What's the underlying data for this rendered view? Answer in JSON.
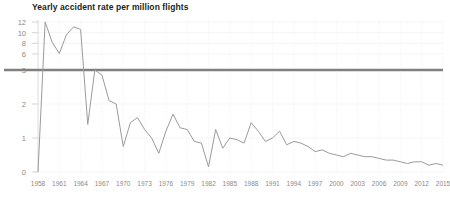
{
  "chart_data": {
    "type": "line",
    "title": "Yearly accident rate per million flights",
    "xlabel": "",
    "ylabel": "",
    "grid": "faint dotted vertical gridlines at every 3rd year",
    "legend": "none",
    "yaxis": {
      "ticks": [
        0,
        1,
        2,
        3,
        6,
        8,
        10,
        12
      ],
      "tick_labels": [
        "0",
        "1",
        "2",
        "3",
        "6",
        "8",
        "10",
        "12"
      ],
      "scale_note": "non-linear: compressed above 3",
      "ylim": [
        0,
        12
      ]
    },
    "xaxis": {
      "tick_labels": [
        "1958",
        "1961",
        "1964",
        "1967",
        "1970",
        "1973",
        "1976",
        "1979",
        "1982",
        "1985",
        "1988",
        "1991",
        "1994",
        "1997",
        "2000",
        "2003",
        "2006",
        "2009",
        "2012",
        "2015"
      ],
      "xlim": [
        1958,
        2015
      ],
      "tick_step": 3
    },
    "reference_line": {
      "value": 3,
      "color": "#808080",
      "label": ""
    },
    "series": [
      {
        "name": "Yearly accident rate per million flights",
        "color": "#9b9b9b",
        "x": [
          1958,
          1959,
          1960,
          1961,
          1962,
          1963,
          1964,
          1965,
          1966,
          1967,
          1968,
          1969,
          1970,
          1971,
          1972,
          1973,
          1974,
          1975,
          1976,
          1977,
          1978,
          1979,
          1980,
          1981,
          1982,
          1983,
          1984,
          1985,
          1986,
          1987,
          1988,
          1989,
          1990,
          1991,
          1992,
          1993,
          1994,
          1995,
          1996,
          1997,
          1998,
          1999,
          2000,
          2001,
          2002,
          2003,
          2004,
          2005,
          2006,
          2007,
          2008,
          2009,
          2010,
          2011,
          2012,
          2013,
          2014,
          2015
        ],
        "values": [
          0,
          12,
          8.2,
          6.1,
          9.6,
          11.1,
          10.6,
          1.4,
          3.0,
          2.85,
          2.1,
          2.0,
          0.75,
          1.45,
          1.6,
          1.25,
          1.0,
          0.55,
          1.2,
          1.7,
          1.3,
          1.25,
          0.9,
          0.85,
          0.15,
          1.25,
          0.7,
          1.0,
          0.95,
          0.85,
          1.45,
          1.2,
          0.9,
          1.0,
          1.2,
          0.8,
          0.9,
          0.85,
          0.75,
          0.6,
          0.65,
          0.55,
          0.5,
          0.45,
          0.55,
          0.5,
          0.45,
          0.45,
          0.4,
          0.35,
          0.35,
          0.3,
          0.25,
          0.3,
          0.3,
          0.2,
          0.25,
          0.2
        ]
      }
    ]
  }
}
